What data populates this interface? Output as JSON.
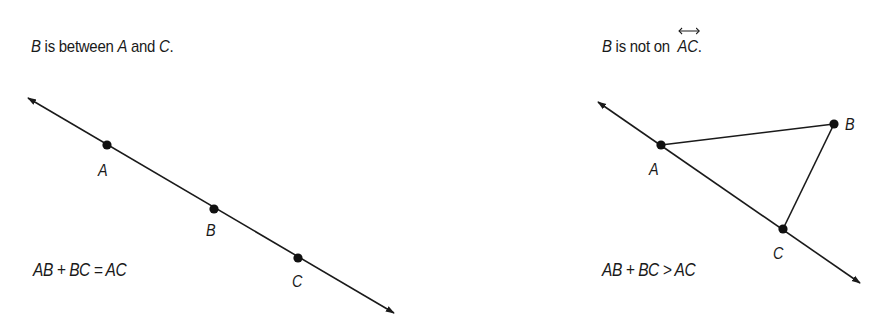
{
  "left": {
    "caption": {
      "p1": "B",
      "p2": " is between ",
      "p3": "A",
      "p4": " and ",
      "p5": "C",
      "p6": "."
    },
    "points": {
      "A": "A",
      "B": "B",
      "C": "C"
    },
    "equation": "AB + BC = AC"
  },
  "right": {
    "caption": {
      "p1": "B",
      "p2": " is not on ",
      "p3": "AC",
      "p4": "."
    },
    "points": {
      "A": "A",
      "B": "B",
      "C": "C"
    },
    "equation": "AB + BC > AC"
  },
  "colors": {
    "ink": "#1a1a1a",
    "background": "#ffffff"
  }
}
